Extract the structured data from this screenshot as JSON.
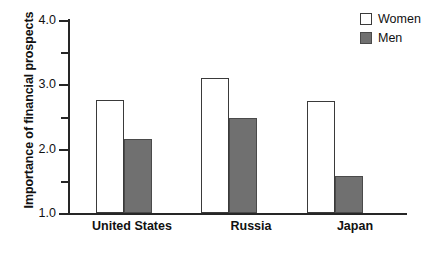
{
  "chart_data": {
    "type": "bar",
    "title": "",
    "xlabel": "",
    "ylabel": "Importance of financial prospects",
    "categories": [
      "United States",
      "Russia",
      "Japan"
    ],
    "series": [
      {
        "name": "Women",
        "values": [
          2.75,
          3.1,
          2.74
        ],
        "color": "#ffffff"
      },
      {
        "name": "Men",
        "values": [
          2.15,
          2.48,
          1.58
        ],
        "color": "#707070"
      }
    ],
    "ylim": [
      1.0,
      4.0
    ],
    "ymajor_ticks": [
      1.0,
      2.0,
      3.0,
      4.0
    ],
    "ymajor_tick_labels": [
      "1.0",
      "2.0",
      "3.0",
      "4.0"
    ],
    "yminor_ticks": [
      1.5,
      2.5,
      3.5
    ],
    "grid": false,
    "legend_position": "top-right",
    "legend_entries": [
      "Women",
      "Men"
    ]
  },
  "axis": {
    "y_title": "Importance of financial prospects",
    "tick_labels": {
      "t40": "4.0",
      "t30": "3.0",
      "t20": "2.0",
      "t10": "1.0"
    }
  },
  "categories": {
    "c0": "United States",
    "c1": "Russia",
    "c2": "Japan"
  },
  "legend": {
    "women": "Women",
    "men": "Men"
  },
  "colors": {
    "men_fill": "#707070",
    "women_fill": "#ffffff",
    "axis": "#262626",
    "text": "#111111"
  }
}
